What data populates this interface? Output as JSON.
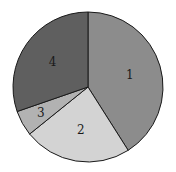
{
  "chart_data": {
    "type": "pie",
    "title": "",
    "categories": [
      "1",
      "2",
      "3",
      "4"
    ],
    "values": [
      41.0,
      23.2,
      5.5,
      30.3
    ],
    "colors": [
      "#8c8c8c",
      "#d3d3d3",
      "#b2b2b2",
      "#5f5f5f"
    ],
    "start_angle_deg": 0,
    "direction": "clockwise",
    "labels_inside": true,
    "legend": "none",
    "center": [
      88,
      87
    ],
    "radius": 75
  }
}
